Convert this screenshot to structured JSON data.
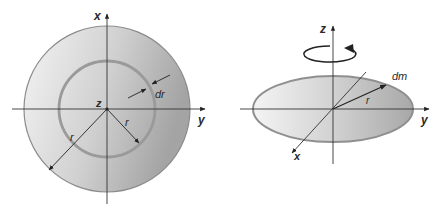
{
  "figure": {
    "left_panel": {
      "title": "Disk top view",
      "axes": {
        "x": "x",
        "y": "y",
        "z": "z"
      },
      "labels": {
        "radius_outer": "r",
        "radius_inner": "r",
        "thickness": "dr"
      }
    },
    "right_panel": {
      "title": "Disk perspective view",
      "axes": {
        "x": "x",
        "y": "y",
        "z": "z"
      },
      "labels": {
        "radius": "r",
        "mass_element": "dm"
      }
    },
    "colors": {
      "disk_fill_light": "#f2f2f2",
      "disk_fill_dark": "#a9a9a9",
      "ring_stroke": "#9a9a9a",
      "outline": "#8c8c8c",
      "axis": "#333333"
    }
  }
}
